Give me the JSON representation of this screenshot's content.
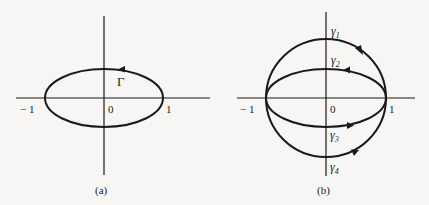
{
  "panels": [
    {
      "id": "a",
      "caption": "(a)",
      "labels": {
        "origin": "0",
        "neg_one": "− 1",
        "pos_one": "1",
        "curve": "Γ"
      },
      "curves": [
        {
          "name": "Gamma",
          "shape": "ellipse",
          "orientation": "counterclockwise"
        }
      ]
    },
    {
      "id": "b",
      "caption": "(b)",
      "labels": {
        "origin": "0",
        "neg_one": "− 1",
        "pos_one": "1",
        "gamma1": "γ",
        "gamma1_sub": "1",
        "gamma2": "γ",
        "gamma2_sub": "2",
        "gamma3": "γ",
        "gamma3_sub": "3",
        "gamma4": "γ",
        "gamma4_sub": "4"
      },
      "curves": [
        {
          "name": "gamma1",
          "shape": "upper semicircle",
          "direction": "from -1 to 1"
        },
        {
          "name": "gamma2",
          "shape": "upper half-ellipse",
          "direction": "from 1 to -1"
        },
        {
          "name": "gamma3",
          "shape": "lower half-ellipse",
          "direction": "from -1 to 1"
        },
        {
          "name": "gamma4",
          "shape": "lower semicircle",
          "direction": "from -1 to 1"
        }
      ]
    }
  ],
  "colors": {
    "ink": "#1a1a1a",
    "paper": "#f7f6f4"
  }
}
